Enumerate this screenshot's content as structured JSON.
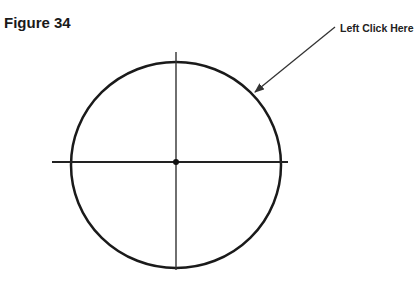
{
  "figure": {
    "title": "Figure 34",
    "callout_label": "Left Click Here"
  },
  "diagram": {
    "type": "circle-with-axes",
    "center": [
      176,
      162
    ],
    "circle": {
      "rx": 105,
      "ry": 103,
      "stroke": "#1a1a1a"
    },
    "horizontal_axis": {
      "x1": 52,
      "x2": 288,
      "y": 162
    },
    "vertical_axis": {
      "y1": 52,
      "y2": 270,
      "x": 176
    },
    "arrow": {
      "from": [
        335,
        27
      ],
      "to": [
        255,
        92
      ],
      "color": "#333333"
    }
  }
}
